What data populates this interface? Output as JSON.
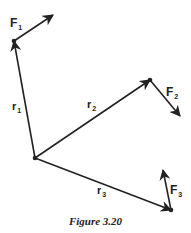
{
  "figure": {
    "caption": "Figure 3.20",
    "stroke_color": "#222222",
    "origin": {
      "x": 35,
      "y": 158
    },
    "position_vectors": [
      {
        "name": "r1",
        "label": "r",
        "subscript": "1",
        "end": {
          "x": 14,
          "y": 41
        },
        "label_pos": {
          "x": 12,
          "y": 110
        }
      },
      {
        "name": "r2",
        "label": "r",
        "subscript": "2",
        "end": {
          "x": 150,
          "y": 80
        },
        "label_pos": {
          "x": 87,
          "y": 108
        }
      },
      {
        "name": "r3",
        "label": "r",
        "subscript": "3",
        "end": {
          "x": 171,
          "y": 210
        },
        "label_pos": {
          "x": 97,
          "y": 194
        }
      }
    ],
    "force_vectors": [
      {
        "name": "F1",
        "label": "F",
        "subscript": "1",
        "start": {
          "x": 14,
          "y": 41
        },
        "end": {
          "x": 53,
          "y": 15
        },
        "label_pos": {
          "x": 10,
          "y": 27
        }
      },
      {
        "name": "F2",
        "label": "F",
        "subscript": "2",
        "start": {
          "x": 150,
          "y": 80
        },
        "end": {
          "x": 180,
          "y": 116
        },
        "label_pos": {
          "x": 166,
          "y": 96
        }
      },
      {
        "name": "F3",
        "label": "F",
        "subscript": "3",
        "start": {
          "x": 171,
          "y": 210
        },
        "end": {
          "x": 163,
          "y": 170
        },
        "label_pos": {
          "x": 170,
          "y": 194
        }
      }
    ]
  }
}
